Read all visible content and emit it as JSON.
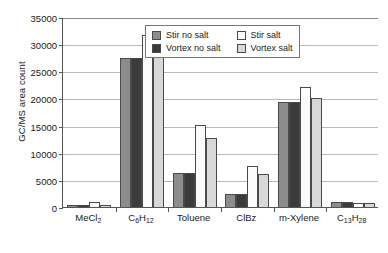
{
  "chart_data": {
    "type": "bar",
    "title": "",
    "xlabel": "",
    "ylabel": "GC/MS area count",
    "ylim": [
      0,
      35000
    ],
    "ytick_interval": 5000,
    "ytick_labels": [
      "0",
      "5000",
      "10000",
      "15000",
      "20000",
      "25000",
      "30000",
      "35000"
    ],
    "ytick_values": [
      0,
      5000,
      10000,
      15000,
      20000,
      25000,
      30000,
      35000
    ],
    "grid": "horizontal",
    "legend_position": "inside-top-center",
    "categories": [
      "MeCl2",
      "C6H12",
      "Toluene",
      "ClBz",
      "m-Xylene",
      "C13H28"
    ],
    "category_labels_html": [
      "MeCl<sub>2</sub>",
      "C<sub>6</sub>H<sub>12</sub>",
      "Toluene",
      "ClBz",
      "m-Xylene",
      "C<sub>13</sub>H<sub>28</sub>"
    ],
    "series": [
      {
        "name": "Stir no salt",
        "color": "#8c8c8c",
        "values": [
          400,
          27500,
          6300,
          2400,
          19400,
          850
        ]
      },
      {
        "name": "Vortex no salt",
        "color": "#3b3b3b",
        "values": [
          350,
          27500,
          6300,
          2400,
          19400,
          850
        ]
      },
      {
        "name": "Stir salt",
        "color": "#fbfbfb",
        "values": [
          950,
          31700,
          15200,
          7500,
          22100,
          800
        ]
      },
      {
        "name": "Vortex salt",
        "color": "#d8d8d8",
        "values": [
          450,
          28500,
          12700,
          6000,
          20000,
          800
        ]
      }
    ]
  },
  "legend": {
    "entries": [
      {
        "label": "Stir no salt",
        "swatch": "s0"
      },
      {
        "label": "Stir salt",
        "swatch": "s2"
      },
      {
        "label": "Vortex no salt",
        "swatch": "s1"
      },
      {
        "label": "Vortex salt",
        "swatch": "s3"
      }
    ]
  }
}
